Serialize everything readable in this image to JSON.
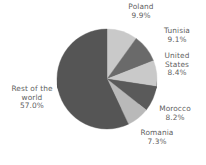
{
  "chart_data": {
    "type": "pie",
    "title": "",
    "subtitle": "",
    "xlabel": "",
    "ylabel": "",
    "legend_position": "none",
    "grid": false,
    "labels_show_percent": true,
    "start_angle_deg": 0,
    "direction": "clockwise",
    "categories": [
      "Poland",
      "Tunisia",
      "United States",
      "Morocco",
      "Romania",
      "Rest of the world"
    ],
    "values": [
      9.9,
      9.1,
      8.4,
      8.2,
      7.3,
      57.0
    ],
    "slices": [
      {
        "name": "Poland",
        "name_line1": "Poland",
        "name_line2": "",
        "name_line3": "",
        "value": 9.9,
        "value_label": "9.9%",
        "color": "#c9c9c9"
      },
      {
        "name": "Tunisia",
        "name_line1": "Tunisia",
        "name_line2": "",
        "name_line3": "",
        "value": 9.1,
        "value_label": "9.1%",
        "color": "#6a6a6a"
      },
      {
        "name": "United States",
        "name_line1": "United",
        "name_line2": "States",
        "name_line3": "",
        "value": 8.4,
        "value_label": "8.4%",
        "color": "#c9c9c9"
      },
      {
        "name": "Morocco",
        "name_line1": "Morocco",
        "name_line2": "",
        "name_line3": "",
        "value": 8.2,
        "value_label": "8.2%",
        "color": "#5a5a5a"
      },
      {
        "name": "Romania",
        "name_line1": "Romania",
        "name_line2": "",
        "name_line3": "",
        "value": 7.3,
        "value_label": "7.3%",
        "color": "#b9b9b9"
      },
      {
        "name": "Rest of the world",
        "name_line1": "Rest of the",
        "name_line2": "world",
        "name_line3": "",
        "value": 57.0,
        "value_label": "57.0%",
        "color": "#555555"
      }
    ],
    "colors": {
      "light_slice": "#c9c9c9",
      "dark_slice": "#555555",
      "label_text": "#5f5f5f",
      "background": "#ffffff",
      "depth_shadow": "#3f3f3f"
    }
  }
}
